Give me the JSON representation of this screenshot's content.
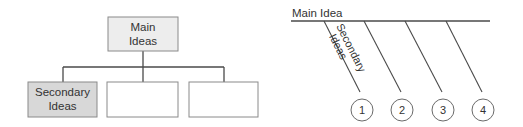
{
  "colors": {
    "line": "#4a4a4a",
    "main_box_fill": "#ededed",
    "secondary_box_fill": "#d8d8d8",
    "empty_box_fill": "#ffffff",
    "text": "#333333"
  },
  "tree_diagram": {
    "root": {
      "line1": "Main",
      "line2": "Ideas"
    },
    "children": [
      {
        "line1": "Secondary",
        "line2": "Ideas",
        "shaded": true
      },
      {
        "line1": "",
        "line2": "",
        "shaded": false
      },
      {
        "line1": "",
        "line2": "",
        "shaded": false
      }
    ]
  },
  "fishbone_diagram": {
    "main_label": "Main Idea",
    "branch_label_line1": "Secondary",
    "branch_label_line2": "Ideas",
    "branches": [
      {
        "number": "1"
      },
      {
        "number": "2"
      },
      {
        "number": "3"
      },
      {
        "number": "4"
      }
    ]
  }
}
